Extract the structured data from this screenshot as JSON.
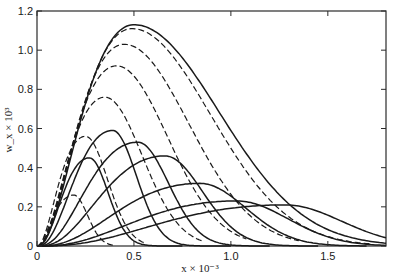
{
  "chart_data": {
    "type": "line",
    "title": "",
    "xlabel": "x × 10⁻³",
    "ylabel": "w_x × 10³",
    "xlim": [
      0,
      1.8
    ],
    "ylim": [
      0,
      1.2
    ],
    "xticks": [
      {
        "value": 0,
        "label": "0"
      },
      {
        "value": 0.5,
        "label": "0.5"
      },
      {
        "value": 1.0,
        "label": "1.0"
      },
      {
        "value": 1.5,
        "label": "1.5"
      }
    ],
    "yticks": [
      {
        "value": 0,
        "label": "0"
      },
      {
        "value": 0.2,
        "label": "0.2"
      },
      {
        "value": 0.4,
        "label": "0.4"
      },
      {
        "value": 0.6,
        "label": "0.6"
      },
      {
        "value": 0.8,
        "label": "0.8"
      },
      {
        "value": 1.0,
        "label": "1.0"
      },
      {
        "value": 1.2,
        "label": "1.2"
      }
    ],
    "grid": false,
    "legend": null,
    "series": [
      {
        "name": "envelope (solid)",
        "style": "solid",
        "peak_x": 0.5,
        "peak_y": 1.13,
        "start_x": 0.0,
        "end_x": 1.8,
        "width_left": 0.22,
        "width_right": 0.5
      },
      {
        "name": "dashed envelope 1",
        "style": "dashed",
        "peak_x": 0.49,
        "peak_y": 1.11,
        "start_x": 0.0,
        "end_x": 1.72,
        "width_left": 0.22,
        "width_right": 0.46
      },
      {
        "name": "dashed envelope 2",
        "style": "dashed",
        "peak_x": 0.45,
        "peak_y": 1.03,
        "start_x": 0.0,
        "end_x": 1.35,
        "width_left": 0.2,
        "width_right": 0.38
      },
      {
        "name": "dashed envelope 3",
        "style": "dashed",
        "peak_x": 0.41,
        "peak_y": 0.92,
        "start_x": 0.0,
        "end_x": 1.08,
        "width_left": 0.18,
        "width_right": 0.3
      },
      {
        "name": "dashed envelope 4",
        "style": "dashed",
        "peak_x": 0.35,
        "peak_y": 0.76,
        "start_x": 0.0,
        "end_x": 0.85,
        "width_left": 0.15,
        "width_right": 0.22
      },
      {
        "name": "dashed envelope 5",
        "style": "dashed",
        "peak_x": 0.25,
        "peak_y": 0.56,
        "start_x": 0.0,
        "end_x": 0.55,
        "width_left": 0.11,
        "width_right": 0.13
      },
      {
        "name": "dashed envelope 6",
        "style": "dashed",
        "peak_x": 0.19,
        "peak_y": 0.26,
        "start_x": 0.0,
        "end_x": 0.4,
        "width_left": 0.09,
        "width_right": 0.08
      },
      {
        "name": "curve 1",
        "style": "solid",
        "peak_x": 0.27,
        "peak_y": 0.45,
        "start_x": 0.0,
        "end_x": 0.75,
        "width_left": 0.1,
        "width_right": 0.11
      },
      {
        "name": "curve 2",
        "style": "solid",
        "peak_x": 0.39,
        "peak_y": 0.59,
        "start_x": 0.0,
        "end_x": 1.0,
        "width_left": 0.14,
        "width_right": 0.14
      },
      {
        "name": "curve 3",
        "style": "solid",
        "peak_x": 0.52,
        "peak_y": 0.53,
        "start_x": 0.0,
        "end_x": 1.2,
        "width_left": 0.18,
        "width_right": 0.18
      },
      {
        "name": "curve 4",
        "style": "solid",
        "peak_x": 0.66,
        "peak_y": 0.46,
        "start_x": 0.0,
        "end_x": 1.45,
        "width_left": 0.22,
        "width_right": 0.22
      },
      {
        "name": "curve 5",
        "style": "solid",
        "peak_x": 0.84,
        "peak_y": 0.32,
        "start_x": 0.0,
        "end_x": 1.7,
        "width_left": 0.28,
        "width_right": 0.27
      },
      {
        "name": "curve 6",
        "style": "solid",
        "peak_x": 1.03,
        "peak_y": 0.23,
        "start_x": 0.0,
        "end_x": 1.8,
        "width_left": 0.34,
        "width_right": 0.3
      },
      {
        "name": "curve 7",
        "style": "solid",
        "peak_x": 1.28,
        "peak_y": 0.21,
        "start_x": 0.0,
        "end_x": 1.8,
        "width_left": 0.42,
        "width_right": 0.33
      }
    ]
  }
}
